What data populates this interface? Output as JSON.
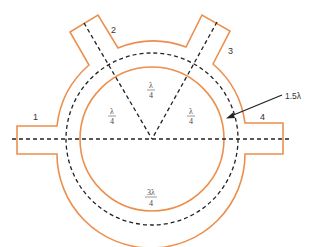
{
  "diagram": {
    "type": "rat-race hybrid ring coupler",
    "colors": {
      "conductor": "#ec8f4e",
      "guide_lines": "#222222",
      "text": "#333333"
    },
    "ports": [
      {
        "id": "1",
        "label": "1"
      },
      {
        "id": "2",
        "label": "2"
      },
      {
        "id": "3",
        "label": "3"
      },
      {
        "id": "4",
        "label": "4"
      }
    ],
    "segments": [
      {
        "between": "1-2",
        "numerator": "λ",
        "denominator": "4"
      },
      {
        "between": "2-3",
        "numerator": "λ",
        "denominator": "4"
      },
      {
        "between": "3-4",
        "numerator": "λ",
        "denominator": "4"
      },
      {
        "between": "4-1",
        "numerator": "3λ",
        "denominator": "4"
      }
    ],
    "callout": {
      "label": "1.5λ",
      "target": "ring mean circumference"
    }
  }
}
